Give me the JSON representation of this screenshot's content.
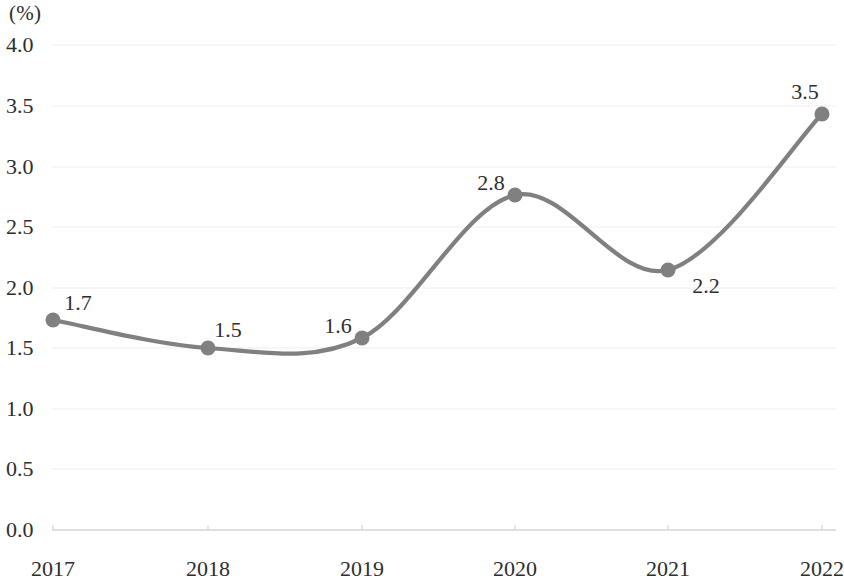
{
  "chart_data": {
    "type": "line",
    "title": "",
    "subtitle": "",
    "xlabel": "",
    "ylabel": "",
    "unit_label": "(%)",
    "categories": [
      "2017",
      "2018",
      "2019",
      "2020",
      "2021",
      "2022"
    ],
    "values": [
      1.7,
      1.5,
      1.6,
      2.8,
      2.2,
      3.5
    ],
    "point_labels": [
      "1.7",
      "1.5",
      "1.6",
      "2.8",
      "2.2",
      "3.5"
    ],
    "series": [
      {
        "name": "",
        "values": [
          1.7,
          1.5,
          1.6,
          2.8,
          2.2,
          3.5
        ]
      }
    ],
    "ylim": [
      0.0,
      4.0
    ],
    "y_ticks": [
      "0.0",
      "0.5",
      "1.0",
      "1.5",
      "2.0",
      "2.5",
      "3.0",
      "3.5",
      "4.0"
    ],
    "y_tick_values": [
      0.0,
      0.5,
      1.0,
      1.5,
      2.0,
      2.5,
      3.0,
      3.5,
      4.0
    ],
    "x_ticks": [
      "2017",
      "2018",
      "2019",
      "2020",
      "2021",
      "2022"
    ],
    "grid": "horizontal",
    "legend": "none",
    "smoothing": "spline",
    "line_color": "#808080",
    "marker_color": "#808080",
    "grid_color": "#ededed",
    "axis_color": "#d6d6d6",
    "text_color": "#2e2e2e",
    "background_color": "#ffffff"
  },
  "plot_geometry": {
    "plot_left": 53,
    "plot_right": 836,
    "y_top_px": 45,
    "y_bottom_px": 530,
    "point_x_px": [
      53,
      208,
      362,
      515,
      668,
      822
    ],
    "point_y_px": [
      320,
      348,
      338,
      195,
      270,
      114
    ],
    "label_positions": [
      {
        "x": 78,
        "y": 303
      },
      {
        "x": 228,
        "y": 330
      },
      {
        "x": 338,
        "y": 326
      },
      {
        "x": 491,
        "y": 183
      },
      {
        "x": 706,
        "y": 286
      },
      {
        "x": 805,
        "y": 92
      }
    ],
    "y_tick_y_px": [
      530,
      469,
      409,
      348,
      288,
      227,
      167,
      106,
      45
    ],
    "x_label_y_px": 558
  }
}
